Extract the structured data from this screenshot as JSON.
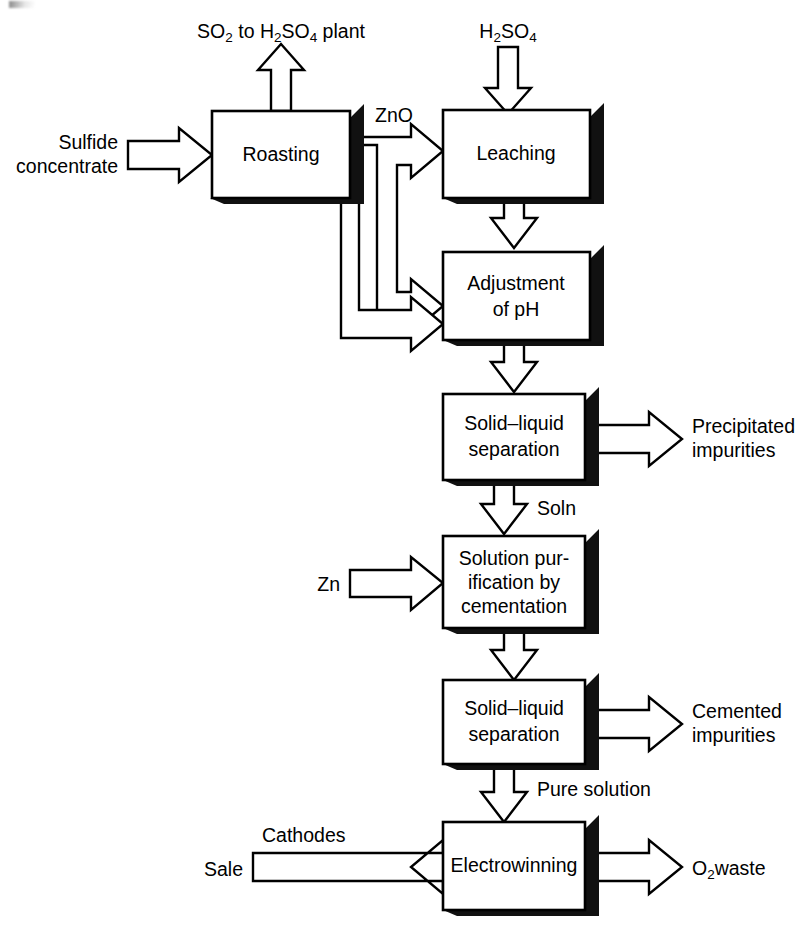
{
  "diagram": {
    "type": "process-flow-diagram",
    "colors": {
      "stroke": "#000000",
      "fill": "#ffffff",
      "shadow": "#111111",
      "background": "#ffffff"
    },
    "process_boxes": [
      {
        "id": "roasting",
        "label": "Roasting",
        "lines": [
          "Roasting"
        ]
      },
      {
        "id": "leaching",
        "label": "Leaching",
        "lines": [
          "Leaching"
        ]
      },
      {
        "id": "ph",
        "label": "Adjustment of pH",
        "lines": [
          "Adjustment",
          "of pH"
        ]
      },
      {
        "id": "sl1",
        "label": "Solid–liquid separation",
        "lines": [
          "Solid–liquid",
          "separation"
        ]
      },
      {
        "id": "purification",
        "label": "Solution purification by cementation",
        "lines": [
          "Solution pur-",
          "ification by",
          "cementation"
        ]
      },
      {
        "id": "sl2",
        "label": "Solid–liquid separation",
        "lines": [
          "Solid–liquid",
          "separation"
        ]
      },
      {
        "id": "electrowinning",
        "label": "Electrowinning",
        "lines": [
          "Electrowinning"
        ]
      }
    ],
    "stream_labels": {
      "so2_out": {
        "pre": "SO",
        "sub1": "2",
        "mid": " to H",
        "sub2": "2",
        "mid2": "SO",
        "sub3": "4",
        "post": " plant",
        "plain": "SO2 to H2SO4 plant"
      },
      "feed": {
        "line1": "Sulfide",
        "line2": "concentrate",
        "plain": "Sulfide concentrate"
      },
      "zno": "ZnO",
      "h2so4_in": {
        "pre": "H",
        "sub1": "2",
        "mid": "SO",
        "sub2": "4",
        "plain": "H2SO4"
      },
      "precipitated": {
        "line1": "Precipitated",
        "line2": "impurities",
        "plain": "Precipitated impurities"
      },
      "soln": "Soln",
      "zn_in": "Zn",
      "cemented": {
        "line1": "Cemented",
        "line2": "impurities",
        "plain": "Cemented impurities"
      },
      "pure_solution": "Pure solution",
      "cathodes": "Cathodes",
      "sale": "Sale",
      "o2_waste": {
        "pre": "O",
        "sub1": "2",
        "post": "waste",
        "plain": "O2 waste"
      }
    },
    "connections": [
      {
        "from": "roasting",
        "to": "so2_out",
        "label": "SO2 to H2SO4 plant",
        "direction": "up"
      },
      {
        "from": "feed",
        "to": "roasting",
        "label": "Sulfide concentrate",
        "direction": "right"
      },
      {
        "from": "roasting",
        "to": "leaching",
        "label": "ZnO",
        "direction": "right"
      },
      {
        "from": "roasting",
        "to": "ph",
        "label": "ZnO",
        "direction": "down-right"
      },
      {
        "from": "h2so4_in",
        "to": "leaching",
        "label": "H2SO4",
        "direction": "down"
      },
      {
        "from": "leaching",
        "to": "ph",
        "label": "",
        "direction": "down"
      },
      {
        "from": "ph",
        "to": "sl1",
        "label": "",
        "direction": "down"
      },
      {
        "from": "sl1",
        "to": "precipitated",
        "label": "Precipitated impurities",
        "direction": "right"
      },
      {
        "from": "sl1",
        "to": "purification",
        "label": "Soln",
        "direction": "down"
      },
      {
        "from": "zn_in",
        "to": "purification",
        "label": "Zn",
        "direction": "right"
      },
      {
        "from": "purification",
        "to": "sl2",
        "label": "",
        "direction": "down"
      },
      {
        "from": "sl2",
        "to": "cemented",
        "label": "Cemented impurities",
        "direction": "right"
      },
      {
        "from": "sl2",
        "to": "electrowinning",
        "label": "Pure solution",
        "direction": "down"
      },
      {
        "from": "electrowinning",
        "to": "sale",
        "label": "Cathodes",
        "direction": "left"
      },
      {
        "from": "electrowinning",
        "to": "o2_waste",
        "label": "O2 waste",
        "direction": "right"
      }
    ]
  }
}
